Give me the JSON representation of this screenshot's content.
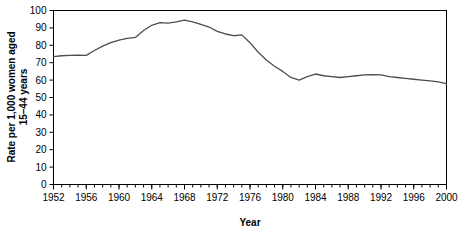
{
  "chart_data": {
    "type": "line",
    "title": "",
    "xlabel": "Year",
    "ylabel": "Rate per 1,000 women aged 15–44 years",
    "ylabel_line1": "Rate per 1,000 women aged",
    "ylabel_line2": "15–44 years",
    "xlim": [
      1952,
      2000
    ],
    "ylim": [
      0,
      100
    ],
    "ytick_step": 10,
    "xtick_step": 4,
    "xminor_step": 1,
    "grid": false,
    "legend": null,
    "line_color": "#4d4d4d",
    "axis_color": "#000000",
    "yticks": [
      0,
      10,
      20,
      30,
      40,
      50,
      60,
      70,
      80,
      90,
      100
    ],
    "xticks": [
      1952,
      1956,
      1960,
      1964,
      1968,
      1972,
      1976,
      1980,
      1984,
      1988,
      1992,
      1996,
      2000
    ],
    "series": [
      {
        "name": "Birth rate",
        "x": [
          1952,
          1953,
          1954,
          1955,
          1956,
          1957,
          1958,
          1959,
          1960,
          1961,
          1962,
          1963,
          1964,
          1965,
          1966,
          1967,
          1968,
          1969,
          1970,
          1971,
          1972,
          1973,
          1974,
          1975,
          1976,
          1977,
          1978,
          1979,
          1980,
          1981,
          1982,
          1983,
          1984,
          1985,
          1986,
          1987,
          1988,
          1989,
          1990,
          1991,
          1992,
          1993,
          1994,
          1995,
          1996,
          1997,
          1998,
          1999,
          2000
        ],
        "values": [
          73.5,
          74.0,
          74.2,
          74.3,
          74.2,
          77.0,
          79.5,
          81.5,
          83.0,
          84.0,
          84.5,
          88.5,
          91.5,
          93.0,
          92.8,
          93.5,
          94.5,
          93.5,
          92.0,
          90.5,
          88.0,
          86.5,
          85.5,
          86.0,
          81.5,
          76.0,
          71.5,
          68.0,
          65.0,
          61.5,
          60.0,
          62.0,
          63.5,
          62.5,
          62.0,
          61.5,
          62.0,
          62.5,
          63.0,
          63.2,
          63.0,
          62.0,
          61.5,
          61.0,
          60.5,
          60.0,
          59.5,
          59.0,
          58.0
        ]
      }
    ]
  }
}
